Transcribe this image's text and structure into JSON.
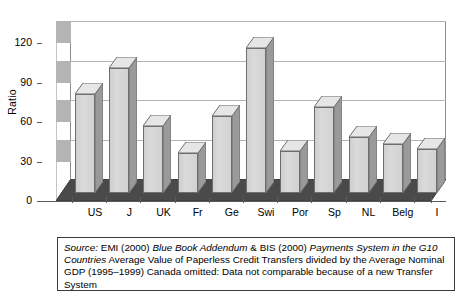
{
  "chart_data": {
    "type": "bar",
    "title": "",
    "subtitle": "",
    "xlabel": "",
    "ylabel": "Ratio",
    "categories": [
      "US",
      "J",
      "UK",
      "Fr",
      "Ge",
      "Swi",
      "Por",
      "Sp",
      "NL",
      "Belg",
      "I"
    ],
    "values": [
      75,
      95,
      51,
      30,
      58,
      110,
      32,
      65,
      42,
      37,
      33
    ],
    "series": [
      {
        "name": "Ratio",
        "values": [
          75,
          95,
          51,
          30,
          58,
          110,
          32,
          65,
          42,
          37,
          33
        ]
      }
    ],
    "ylim": [
      0,
      120
    ],
    "ytick_labels": [
      "0",
      "30",
      "60",
      "90",
      "120"
    ],
    "ytick_values": [
      0,
      30,
      60,
      90,
      120
    ],
    "grid": true,
    "legend": "none",
    "style": "3d-column",
    "colors": {
      "bar_face": "#d6d6d6",
      "bar_side": "#9a9a9a",
      "bar_top": "#e6e6e6",
      "bar_outline": "#6e6e6e",
      "floor": "#4a4a4a",
      "gridline": "#b4b4b4",
      "axis": "#5a5a5a",
      "text": "#000000"
    }
  },
  "caption": {
    "source_label": "Source:",
    "line_1_a": " EMI (2000) ",
    "italic_1": "Blue Book Addendum",
    "line_1_b": " & BIS (2000) ",
    "italic_2": "Payments System in the G10 Countries",
    "line_2": " Average Value of Paperless Credit Transfers divided by the Average Nominal GDP (1995–1999) Canada omitted: Data not comparable because of a new Transfer System"
  }
}
